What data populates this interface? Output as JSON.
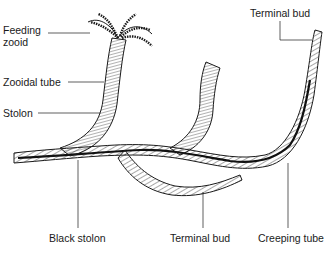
{
  "diagram": {
    "labels": {
      "feeding_zooid_line1": "Feeding",
      "feeding_zooid_line2": "zooid",
      "zooidal_tube": "Zooidal tube",
      "stolon": "Stolon",
      "terminal_bud_top": "Terminal bud",
      "black_stolon": "Black stolon",
      "terminal_bud_bottom": "Terminal bud",
      "creeping_tube": "Creeping tube"
    },
    "colors": {
      "ink": "#1a1a1a",
      "background": "#ffffff"
    }
  }
}
